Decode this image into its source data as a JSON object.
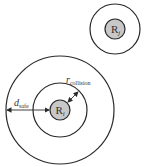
{
  "diagram": {
    "colors": {
      "stroke": "#2a2a2a",
      "robot_fill": "#c8c8c8",
      "background": "#ffffff"
    },
    "robot_j": {
      "label": "R",
      "subscript": "j",
      "center": [
        115,
        29
      ],
      "robot_radius": 10,
      "outer_radius": 25
    },
    "robot_i": {
      "label": "R",
      "subscript": "i",
      "center": [
        60,
        110
      ],
      "robot_radius": 10,
      "collision_radius": 27,
      "safe_radius": 54
    },
    "annotations": {
      "r_collision": {
        "symbol": "r",
        "subscript": "collision"
      },
      "d_safe": {
        "symbol": "d",
        "subscript": "safe"
      }
    }
  }
}
